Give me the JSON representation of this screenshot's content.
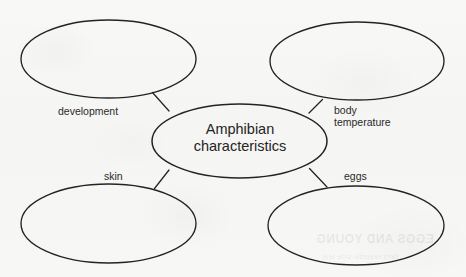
{
  "diagram": {
    "type": "concept-map",
    "title": "Amphibian characteristics",
    "center": {
      "line1": "Amphibian",
      "line2": "characteristics"
    },
    "branches": [
      {
        "id": "development",
        "label": "development",
        "label_line1": "development",
        "label_line2": "",
        "position": "top-left",
        "bubble_empty": true
      },
      {
        "id": "body-temperature",
        "label": "body temperature",
        "label_line1": "body",
        "label_line2": "temperature",
        "position": "top-right",
        "bubble_empty": true
      },
      {
        "id": "skin",
        "label": "skin",
        "label_line1": "skin",
        "label_line2": "",
        "position": "bottom-left",
        "bubble_empty": true
      },
      {
        "id": "eggs",
        "label": "eggs",
        "label_line1": "eggs",
        "label_line2": "",
        "position": "bottom-right",
        "bubble_empty": true
      }
    ],
    "colors": {
      "paper": "#f7f7f5",
      "stroke": "#232323",
      "text": "#2a2a2a"
    }
  },
  "bleed_through": {
    "line1": "EGGS AND YOUNG",
    "line2": "faint reverse-side text"
  }
}
